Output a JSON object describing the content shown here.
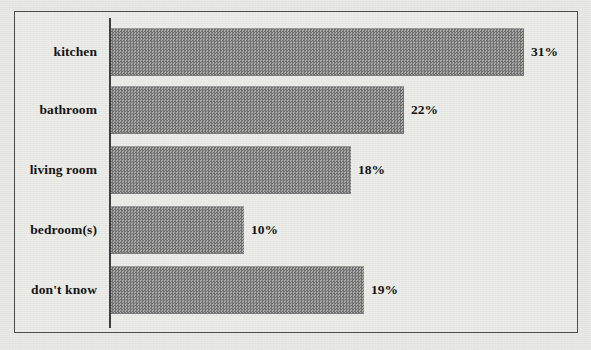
{
  "chart_data": {
    "type": "bar",
    "orientation": "horizontal",
    "title": "",
    "subtitle": "",
    "xlabel": "",
    "ylabel": "",
    "categories": [
      "kitchen",
      "bathroom",
      "living room",
      "bedroom(s)",
      "don't know"
    ],
    "values": [
      31,
      22,
      18,
      10,
      19
    ],
    "value_labels": [
      "31%",
      "22%",
      "18%",
      "10%",
      "19%"
    ],
    "value_suffix": "%",
    "xlim": [
      0,
      35
    ],
    "grid": false,
    "legend": null,
    "legend_position": "none",
    "axis_tick_labels": [],
    "annotations": [],
    "colors": {
      "bar_fill": "#8d8d8d",
      "bar_pattern_dark": "#6f6f6f",
      "bar_pattern_light": "#a8a8a8",
      "axis_line": "#3c3c3c",
      "frame_border": "#4a4a4a",
      "plot_background": "#ecece9",
      "page_background": "#e9e9e6",
      "text": "#111111"
    }
  }
}
